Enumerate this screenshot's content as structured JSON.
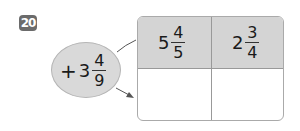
{
  "problem": {
    "number": "20",
    "operator": {
      "sign": "+",
      "whole": "3",
      "numerator": "4",
      "denominator": "9"
    },
    "table": {
      "inputs": [
        {
          "whole": "5",
          "numerator": "4",
          "denominator": "5"
        },
        {
          "whole": "2",
          "numerator": "3",
          "denominator": "4"
        }
      ],
      "outputs": [
        "",
        ""
      ]
    }
  },
  "colors": {
    "badge": "#6b6b6b",
    "ellipse_fill": "#d9d9d9",
    "header_fill": "#d4d4d4",
    "border": "#aaaaaa"
  }
}
